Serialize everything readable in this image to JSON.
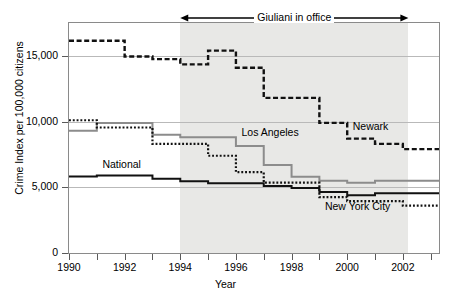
{
  "chart_data": {
    "type": "line",
    "title": "",
    "xlabel": "Year",
    "ylabel": "Crime Index per 100,000 citizens",
    "xlim": [
      1990,
      2003.3
    ],
    "ylim": [
      0,
      17500
    ],
    "yticks": [
      0,
      5000,
      10000,
      15000
    ],
    "ytick_labels": [
      "0",
      "5,000",
      "10,000",
      "15,000"
    ],
    "xticks": [
      1990,
      1991,
      1992,
      1993,
      1994,
      1995,
      1996,
      1997,
      1998,
      1999,
      2000,
      2001,
      2002,
      2003
    ],
    "xtick_labels": [
      "1990",
      "",
      "1992",
      "",
      "1994",
      "",
      "1996",
      "",
      "1998",
      "",
      "2000",
      "",
      "2002",
      ""
    ],
    "grid": "horizontal",
    "legend": "inline-labels",
    "step_style": "post",
    "shaded_region": {
      "label": "Giuliani in office",
      "x_start": 1994.0,
      "x_end": 2002.2,
      "color": "#e8e8e6"
    },
    "annotation": {
      "text": "Giuliani in office",
      "arrow": "double",
      "x_start": 1994.0,
      "x_end": 2002.2,
      "y": 17200
    },
    "series": [
      {
        "name": "Newark",
        "style": "dashed",
        "color": "#111111",
        "label_x": 2000.2,
        "label_y": 9600,
        "x": [
          1990,
          1991,
          1992,
          1993,
          1994,
          1995,
          1996,
          1997,
          1998,
          1999,
          2000,
          2001,
          2002,
          2003.3
        ],
        "values": [
          16150,
          16150,
          14950,
          14750,
          14350,
          15400,
          14100,
          11800,
          11800,
          9900,
          8700,
          8300,
          7900,
          7900
        ]
      },
      {
        "name": "Los Angeles",
        "style": "solid",
        "color": "#8c8c8c",
        "label_x": 1996.2,
        "label_y": 9100,
        "x": [
          1990,
          1991,
          1992,
          1993,
          1994,
          1995,
          1996,
          1997,
          1998,
          1999,
          2000,
          2001,
          2002,
          2003.3
        ],
        "values": [
          9300,
          9900,
          9900,
          9000,
          8800,
          8800,
          8150,
          6700,
          5800,
          5500,
          5350,
          5500,
          5500,
          5500
        ]
      },
      {
        "name": "National",
        "style": "solid",
        "color": "#111111",
        "label_x": 1991.2,
        "label_y": 6700,
        "x": [
          1990,
          1991,
          1992,
          1993,
          1994,
          1995,
          1996,
          1997,
          1998,
          1999,
          2000,
          2001,
          2002,
          2003.3
        ],
        "values": [
          5820,
          5900,
          5900,
          5650,
          5450,
          5300,
          5300,
          5100,
          4950,
          4650,
          4400,
          4550,
          4550,
          4550
        ]
      },
      {
        "name": "New York City",
        "style": "dotted",
        "color": "#111111",
        "label_x": 1999.2,
        "label_y": 3500,
        "x": [
          1990,
          1991,
          1992,
          1993,
          1994,
          1995,
          1996,
          1997,
          1998,
          1999,
          2000,
          2001,
          2002,
          2003.3
        ],
        "values": [
          10100,
          9550,
          9550,
          8300,
          8300,
          7400,
          6150,
          5350,
          5350,
          4250,
          3950,
          3950,
          3600,
          3600
        ]
      }
    ]
  },
  "axis": {
    "x_title": "Year",
    "y_title": "Crime Index per 100,000 citizens"
  },
  "labels": {
    "newark": "Newark",
    "los_angeles": "Los Angeles",
    "national": "National",
    "new_york_city": "New York City",
    "giuliani": "Giuliani in office"
  },
  "yticks": {
    "t0": "0",
    "t1": "5,000",
    "t2": "10,000",
    "t3": "15,000"
  },
  "xticks": {
    "t1990": "1990",
    "t1992": "1992",
    "t1994": "1994",
    "t1996": "1996",
    "t1998": "1998",
    "t2000": "2000",
    "t2002": "2002"
  }
}
